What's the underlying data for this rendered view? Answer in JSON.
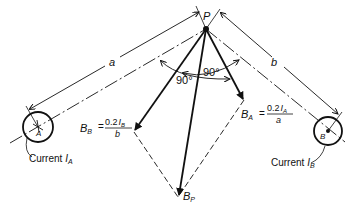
{
  "diagram": {
    "point_label": "P",
    "distance_a_label": "a",
    "distance_b_label": "b",
    "angle_left_label": "90°",
    "angle_right_label": "90°",
    "conductor_a": {
      "label": "A",
      "current_caption_prefix": "Current ",
      "current_symbol": "I",
      "current_subscript": "A"
    },
    "conductor_b": {
      "label": "B",
      "current_caption_prefix": "Current ",
      "current_symbol": "I",
      "current_subscript": "B"
    },
    "vector_bb": {
      "symbol": "B",
      "subscript": "B",
      "equals": "=",
      "numerator": "0.2",
      "numerator_symbol": "I",
      "numerator_subscript": "B",
      "denominator": "b"
    },
    "vector_ba": {
      "symbol": "B",
      "subscript": "A",
      "equals": "=",
      "numerator": "0.2",
      "numerator_symbol": "I",
      "numerator_subscript": "A",
      "denominator": "a"
    },
    "resultant": {
      "symbol": "B",
      "subscript": "P"
    },
    "colors": {
      "ink": "#111111",
      "background": "#ffffff"
    }
  }
}
